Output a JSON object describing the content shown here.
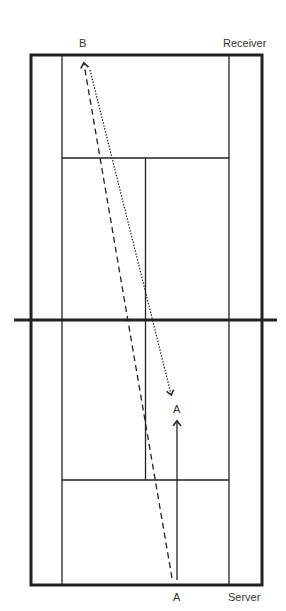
{
  "labels": {
    "b": "B",
    "receiver": "Receiver",
    "a_mid": "A",
    "a_bottom": "A",
    "server": "Server"
  },
  "court": {
    "line_color": "#222222"
  }
}
